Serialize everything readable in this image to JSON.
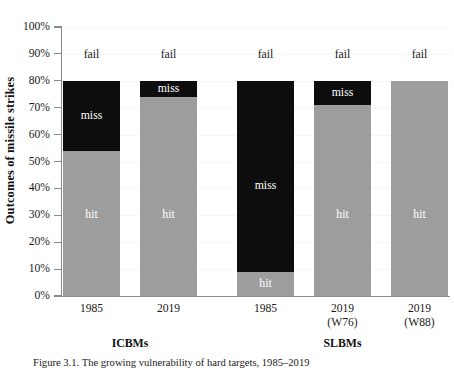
{
  "figure": {
    "caption": "Figure 3.1. The growing vulnerability of hard targets, 1985–2019"
  },
  "chart_data": {
    "type": "bar",
    "subtype": "stacked",
    "title": "",
    "xlabel": "",
    "ylabel": "Outcomes of missile strikes",
    "ylim": [
      0,
      100
    ],
    "yticks": [
      "0%",
      "10%",
      "20%",
      "30%",
      "40%",
      "50%",
      "60%",
      "70%",
      "80%",
      "90%",
      "100%"
    ],
    "ytick_values": [
      0,
      10,
      20,
      30,
      40,
      50,
      60,
      70,
      80,
      90,
      100
    ],
    "grid": false,
    "legend": "none",
    "categories": [
      "1985",
      "2019",
      "1985",
      "2019\n(W76)",
      "2019\n(W88)"
    ],
    "groups": [
      {
        "name": "ICBMs",
        "bars": [
          0,
          1
        ]
      },
      {
        "name": "SLBMs",
        "bars": [
          2,
          3,
          4
        ]
      }
    ],
    "series": [
      {
        "name": "hit",
        "color": "#9d9d9d",
        "values": [
          54,
          74,
          9,
          71,
          80
        ]
      },
      {
        "name": "miss",
        "color": "#0d0d0d",
        "values": [
          26,
          6,
          71,
          9,
          0
        ]
      },
      {
        "name": "fail",
        "color": "#ffffff",
        "values": [
          20,
          20,
          20,
          20,
          20
        ]
      }
    ]
  },
  "bars": [
    {
      "x_label_line1": "1985",
      "x_label_line2": "",
      "group": "ICBMs",
      "hit": {
        "label": "hit",
        "from": 0,
        "to": 54
      },
      "miss": {
        "label": "miss",
        "from": 54,
        "to": 80
      },
      "fail": {
        "label": "fail",
        "from": 80,
        "to": 100
      }
    },
    {
      "x_label_line1": "2019",
      "x_label_line2": "",
      "group": "ICBMs",
      "hit": {
        "label": "hit",
        "from": 0,
        "to": 74
      },
      "miss": {
        "label": "miss",
        "from": 74,
        "to": 80
      },
      "fail": {
        "label": "fail",
        "from": 80,
        "to": 100
      }
    },
    {
      "x_label_line1": "1985",
      "x_label_line2": "",
      "group": "SLBMs",
      "hit": {
        "label": "hit",
        "from": 0,
        "to": 9
      },
      "miss": {
        "label": "miss",
        "from": 9,
        "to": 80
      },
      "fail": {
        "label": "fail",
        "from": 80,
        "to": 100
      }
    },
    {
      "x_label_line1": "2019",
      "x_label_line2": "(W76)",
      "group": "SLBMs",
      "hit": {
        "label": "hit",
        "from": 0,
        "to": 71
      },
      "miss": {
        "label": "miss",
        "from": 71,
        "to": 80
      },
      "fail": {
        "label": "fail",
        "from": 80,
        "to": 100
      }
    },
    {
      "x_label_line1": "2019",
      "x_label_line2": "(W88)",
      "group": "SLBMs",
      "hit": {
        "label": "hit",
        "from": 0,
        "to": 80
      },
      "miss": {
        "label": "",
        "from": 80,
        "to": 80
      },
      "fail": {
        "label": "fail",
        "from": 80,
        "to": 100
      }
    }
  ],
  "group_titles": [
    "ICBMs",
    "SLBMs"
  ],
  "colors": {
    "hit": "#9d9d9d",
    "miss": "#0d0d0d",
    "fail": "#ffffff",
    "axis": "#8a8a8a",
    "text": "#1a1a1a",
    "background": "#ffffff"
  }
}
